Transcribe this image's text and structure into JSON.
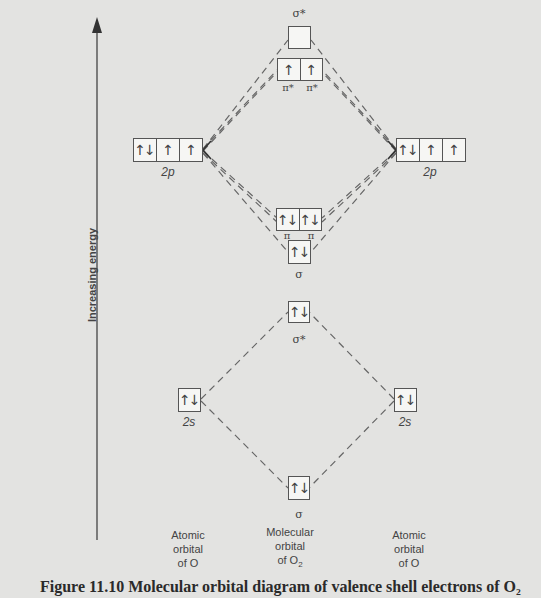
{
  "axis": {
    "label": "Increasing energy",
    "direction": "up"
  },
  "columns": {
    "left": {
      "line1": "Atomic",
      "line2": "orbital",
      "line3": "of O"
    },
    "middle": {
      "line1": "Molecular",
      "line2": "orbital",
      "line3": "of O",
      "subscript": "2"
    },
    "right": {
      "line1": "Atomic",
      "line2": "orbital",
      "line3": "of O"
    }
  },
  "atomic_orbitals": {
    "left_2p": {
      "label": "2p",
      "cells": [
        "↑↓",
        "↑",
        "↑"
      ]
    },
    "right_2p": {
      "label": "2p",
      "cells": [
        "↑↓",
        "↑",
        "↑"
      ]
    },
    "left_2s": {
      "label": "2s",
      "cells": [
        "↑↓"
      ]
    },
    "right_2s": {
      "label": "2s",
      "cells": [
        "↑↓"
      ]
    }
  },
  "molecular_orbitals": {
    "sigma_star_2p": {
      "label": "σ*",
      "cells": [
        ""
      ]
    },
    "pi_star_2p": {
      "labels": [
        "π*",
        "π*"
      ],
      "cells": [
        "↑",
        "↑"
      ]
    },
    "pi_2p": {
      "labels": [
        "π",
        "π"
      ],
      "cells": [
        "↑↓",
        "↑↓"
      ]
    },
    "sigma_2p": {
      "label": "σ",
      "cells": [
        "↑↓"
      ]
    },
    "sigma_star_2s": {
      "label": "σ*",
      "cells": [
        "↑↓"
      ]
    },
    "sigma_2s": {
      "label": "σ",
      "cells": [
        "↑↓"
      ]
    }
  },
  "caption": "Figure 11.10   Molecular orbital diagram of valence shell electrons of O₂"
}
